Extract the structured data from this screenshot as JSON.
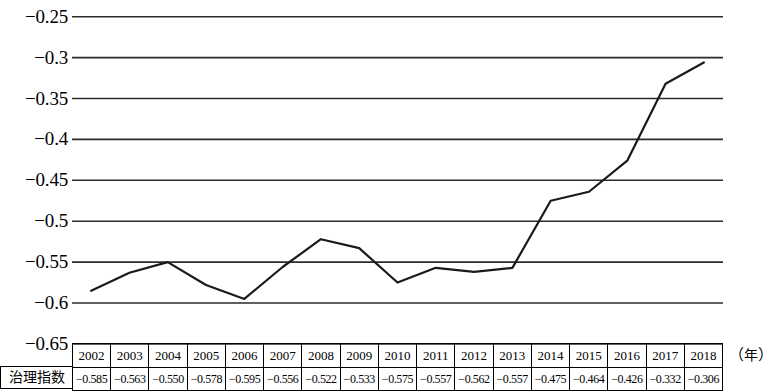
{
  "chart_data": {
    "type": "line",
    "title": "",
    "subtitle": "",
    "xlabel": "（年）",
    "ylabel": "",
    "x": [
      2002,
      2003,
      2004,
      2005,
      2006,
      2007,
      2008,
      2009,
      2010,
      2011,
      2012,
      2013,
      2014,
      2015,
      2016,
      2017,
      2018
    ],
    "categories": [
      "2002",
      "2003",
      "2004",
      "2005",
      "2006",
      "2007",
      "2008",
      "2009",
      "2010",
      "2011",
      "2012",
      "2013",
      "2014",
      "2015",
      "2016",
      "2017",
      "2018"
    ],
    "series": [
      {
        "name": "治理指数",
        "values": [
          -0.585,
          -0.563,
          -0.55,
          -0.578,
          -0.595,
          -0.556,
          -0.522,
          -0.533,
          -0.575,
          -0.557,
          -0.562,
          -0.557,
          -0.475,
          -0.464,
          -0.426,
          -0.332,
          -0.306
        ]
      }
    ],
    "value_labels": [
      "-0.585",
      "-0.563",
      "-0.550",
      "-0.578",
      "-0.595",
      "-0.556",
      "-0.522",
      "-0.533",
      "-0.575",
      "-0.557",
      "-0.562",
      "-0.557",
      "-0.475",
      "-0.464",
      "-0.426",
      "-0.332",
      "-0.306"
    ],
    "ylim": [
      -0.65,
      -0.25
    ],
    "ytick_values": [
      -0.25,
      -0.3,
      -0.35,
      -0.4,
      -0.45,
      -0.5,
      -0.55,
      -0.6,
      -0.65
    ],
    "ytick_labels": [
      "−0.25",
      "−0.3",
      "−0.35",
      "−0.4",
      "−0.45",
      "−0.5",
      "−0.55",
      "−0.6",
      "−0.65"
    ],
    "grid": true,
    "grid_orientation": "horizontal",
    "legend": "none",
    "line_color": "#1a1a1a",
    "grid_color": "#2b2b2b",
    "markers": false
  },
  "table": {
    "row_label": "治理指数",
    "years": [
      "2002",
      "2003",
      "2004",
      "2005",
      "2006",
      "2007",
      "2008",
      "2009",
      "2010",
      "2011",
      "2012",
      "2013",
      "2014",
      "2015",
      "2016",
      "2017",
      "2018"
    ],
    "values": [
      "−0.585",
      "−0.563",
      "−0.550",
      "−0.578",
      "−0.595",
      "−0.556",
      "−0.522",
      "−0.533",
      "−0.575",
      "−0.557",
      "−0.562",
      "−0.557",
      "−0.475",
      "−0.464",
      "−0.426",
      "−0.332",
      "−0.306"
    ]
  },
  "axis_unit": {
    "open": "（",
    "text": "年",
    "close": "）"
  }
}
